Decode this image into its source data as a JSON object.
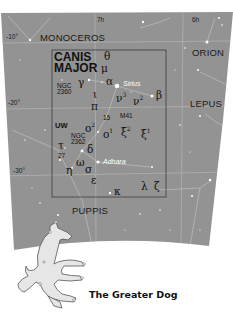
{
  "map": {
    "background_color": "#939393",
    "grid_color": "#b8b8b8",
    "star_color": "#ffffff",
    "box_color": "#3c3c3c",
    "ra_labels": [
      {
        "text": "7h",
        "x": 97,
        "y": 17
      },
      {
        "text": "6h",
        "x": 192,
        "y": 17
      }
    ],
    "dec_labels": [
      {
        "text": "-10°",
        "x": 6,
        "y": 36
      },
      {
        "text": "-20°",
        "x": 8,
        "y": 101
      },
      {
        "text": "-30°",
        "x": 13,
        "y": 168
      }
    ],
    "constellations": {
      "monoceros": "MONOCEROS",
      "orion": "ORION",
      "lepus": "LEPUS",
      "puppis": "PUPPIS",
      "canis_major_line1": "CANIS",
      "canis_major_line2": "MAJOR"
    },
    "objects": {
      "ngc2360_line1": "NGC",
      "ngc2360_line2": "2360",
      "ngc2362_line1": "NGC",
      "ngc2362_line2": "2362",
      "m41": "M41",
      "num15": "15",
      "num27": "27",
      "uw": "UW"
    },
    "star_names": {
      "sirius": "Sirius",
      "adhara": "Adhara"
    },
    "greek": {
      "theta": "θ",
      "mu": "μ",
      "gamma": "γ",
      "alpha": "α",
      "iota": "ι",
      "beta": "β",
      "nu3": "ν",
      "nu3_sup": "3",
      "nu2": "ν",
      "nu2_sup": "2",
      "pi": "π",
      "omicron2": "ο",
      "omicron2_sup": "2",
      "omicron1": "ο",
      "omicron1_sup": "1",
      "xi2": "ξ",
      "xi2_sup": "2",
      "xi1": "ξ",
      "xi1_sup": "1",
      "tau": "τ",
      "delta": "δ",
      "omega": "ω",
      "eta": "η",
      "sigma": "σ",
      "epsilon": "ε",
      "kappa": "κ",
      "lambda": "λ",
      "zeta": "ζ"
    }
  },
  "caption": "The Greater Dog"
}
